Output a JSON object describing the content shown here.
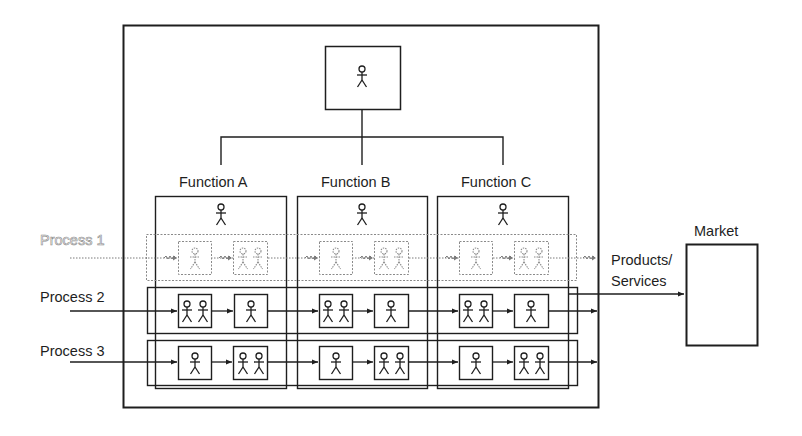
{
  "top_manager": {
    "figures": 1
  },
  "functions": [
    {
      "label": "Function A",
      "head_figures": 1
    },
    {
      "label": "Function B",
      "head_figures": 1
    },
    {
      "label": "Function C",
      "head_figures": 1
    }
  ],
  "processes": [
    {
      "label": "Process 1",
      "style": "dotted-gray",
      "node_figures": [
        1,
        2
      ]
    },
    {
      "label": "Process 2",
      "style": "solid",
      "node_figures": [
        2,
        1
      ]
    },
    {
      "label": "Process 3",
      "style": "solid",
      "node_figures": [
        1,
        2
      ]
    }
  ],
  "output": {
    "label_line1": "Products/",
    "label_line2": "Services"
  },
  "market": {
    "label": "Market"
  },
  "colors": {
    "line": "#1e1e1e",
    "dotted": "#7a7a7a",
    "background": "#ffffff"
  }
}
